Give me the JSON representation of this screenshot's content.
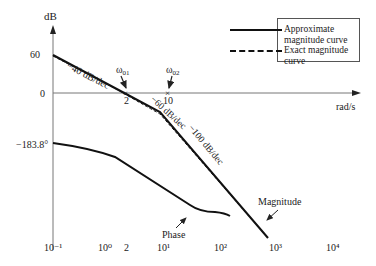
{
  "axes": {
    "y_label": "dB",
    "x_label": "rad/s",
    "y_ticks": [
      "60",
      "0"
    ],
    "phase_start_label": "−183.8°",
    "x_ticks": [
      "10⁻¹",
      "10⁰",
      "2",
      "10¹",
      "10²",
      "10³",
      "10⁴"
    ]
  },
  "annotations": {
    "slope1": "−40 dB/dec",
    "slope2": "−60 dB/dec",
    "slope3": "−100 dB/dec",
    "corner1_label": "ω",
    "corner1_sub": "01",
    "corner2_label": "ω",
    "corner2_sub": "02",
    "corner1_value": "2",
    "corner2_value": "10",
    "magnitude_label": "Magnitude",
    "phase_label": "Phase"
  },
  "legend": {
    "items": [
      {
        "label": "Approximate magnitude curve",
        "style": "solid"
      },
      {
        "label": "Exact magnitude curve",
        "style": "dashed"
      }
    ]
  },
  "colors": {
    "line": "#111111",
    "axis": "#777777",
    "text": "#222222"
  }
}
